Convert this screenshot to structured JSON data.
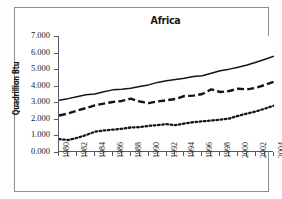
{
  "chart_data": {
    "type": "line",
    "title": "Africa",
    "xlabel": "",
    "ylabel": "Quadrillion Btu",
    "ylim": [
      0,
      7
    ],
    "ytick_labels": [
      "0.000",
      "1.000",
      "2.000",
      "3.000",
      "4.000",
      "5.000",
      "6.000",
      "7.000"
    ],
    "ytick_values": [
      0,
      1,
      2,
      3,
      4,
      5,
      6,
      7
    ],
    "xlim": [
      1980,
      2004
    ],
    "grid": false,
    "legend": "none",
    "x": [
      1980,
      1981,
      1982,
      1983,
      1984,
      1985,
      1986,
      1987,
      1988,
      1989,
      1990,
      1991,
      1992,
      1993,
      1994,
      1995,
      1996,
      1997,
      1998,
      1999,
      2000,
      2001,
      2002,
      2003,
      2004
    ],
    "xtick_labels": [
      "1980",
      "1982",
      "1984",
      "1986",
      "1988",
      "1990",
      "1992",
      "1994",
      "1996",
      "1998",
      "2000",
      "2002",
      "2004"
    ],
    "xtick_values": [
      1980,
      1982,
      1984,
      1986,
      1988,
      1990,
      1992,
      1994,
      1996,
      1998,
      2000,
      2002,
      2004
    ],
    "series": [
      {
        "name": "total",
        "style": "solid",
        "values": [
          3.12,
          3.22,
          3.34,
          3.45,
          3.5,
          3.63,
          3.75,
          3.78,
          3.85,
          3.95,
          4.05,
          4.2,
          4.3,
          4.38,
          4.45,
          4.55,
          4.6,
          4.75,
          4.9,
          5.0,
          5.12,
          5.25,
          5.42,
          5.6,
          5.78
        ]
      },
      {
        "name": "middle",
        "style": "dashed",
        "values": [
          2.2,
          2.32,
          2.5,
          2.65,
          2.82,
          2.92,
          3.02,
          3.08,
          3.22,
          3.05,
          2.95,
          3.05,
          3.12,
          3.2,
          3.38,
          3.4,
          3.5,
          3.78,
          3.62,
          3.68,
          3.82,
          3.78,
          3.88,
          4.05,
          4.25
        ]
      },
      {
        "name": "lower",
        "style": "dotted",
        "values": [
          0.78,
          0.72,
          0.85,
          1.02,
          1.22,
          1.3,
          1.35,
          1.4,
          1.48,
          1.5,
          1.58,
          1.62,
          1.68,
          1.62,
          1.72,
          1.8,
          1.85,
          1.9,
          1.95,
          2.02,
          2.18,
          2.32,
          2.45,
          2.62,
          2.8
        ]
      }
    ]
  },
  "colors": {
    "line": "#151515",
    "axis": "#5a5a5a",
    "border": "#8d8d8d",
    "background": "#ffffff"
  }
}
